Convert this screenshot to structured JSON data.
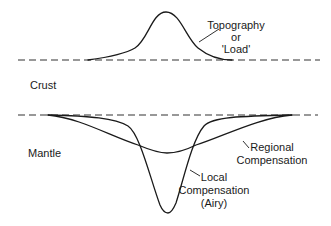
{
  "diagram": {
    "labels": {
      "topography_line1": "Topography",
      "topography_line2": "or",
      "topography_line3": "'Load'",
      "crust": "Crust",
      "mantle": "Mantle",
      "regional_line1": "Regional",
      "regional_line2": "Compensation",
      "local_line1": "Local",
      "local_line2": "Compensation",
      "local_line3": "(Airy)"
    },
    "colors": {
      "stroke": "#1a1a1a",
      "dashed": "#333333",
      "background": "#ffffff"
    }
  }
}
